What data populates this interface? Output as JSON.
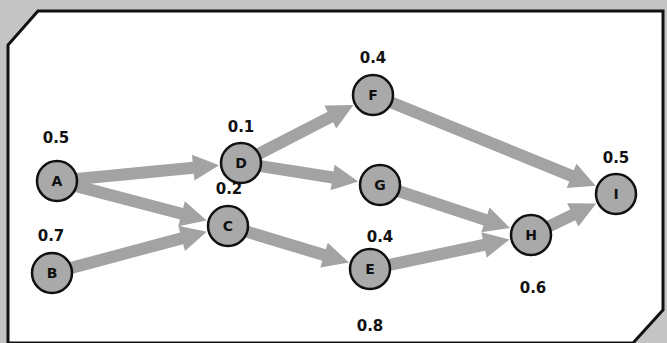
{
  "diagram": {
    "type": "directed-acyclic-graph",
    "colors": {
      "background": "#c4c4c4",
      "panel": "#ffffff",
      "node_fill": "#a9a9a9",
      "edge": "#a3a3a3",
      "stroke": "#111111"
    },
    "nodes": [
      {
        "id": "A",
        "label": "A",
        "value": "0.5",
        "x": 57,
        "y": 181,
        "vx": 56,
        "vy": 138,
        "vanchor": "middle"
      },
      {
        "id": "B",
        "label": "B",
        "value": "0.7",
        "x": 52,
        "y": 273,
        "vx": 51,
        "vy": 236,
        "vanchor": "middle"
      },
      {
        "id": "C",
        "label": "C",
        "value": "0.2",
        "x": 228,
        "y": 226,
        "vx": 229,
        "vy": 189,
        "vanchor": "middle"
      },
      {
        "id": "D",
        "label": "D",
        "value": "0.1",
        "x": 241,
        "y": 163,
        "vx": 241,
        "vy": 127,
        "vanchor": "middle"
      },
      {
        "id": "E",
        "label": "E",
        "value": "0.8",
        "x": 370,
        "y": 269,
        "vx": 370,
        "vy": 326,
        "vanchor": "middle"
      },
      {
        "id": "F",
        "label": "F",
        "value": "0.4",
        "x": 373,
        "y": 95,
        "vx": 373,
        "vy": 58,
        "vanchor": "middle"
      },
      {
        "id": "G",
        "label": "G",
        "value": "0.4",
        "x": 380,
        "y": 185,
        "vx": 380,
        "vy": 237,
        "vanchor": "middle"
      },
      {
        "id": "H",
        "label": "H",
        "value": "0.6",
        "x": 531,
        "y": 235,
        "vx": 533,
        "vy": 288,
        "vanchor": "middle"
      },
      {
        "id": "I",
        "label": "I",
        "value": "0.5",
        "x": 616,
        "y": 194,
        "vx": 616,
        "vy": 158,
        "vanchor": "middle"
      }
    ],
    "edges": [
      {
        "from": "A",
        "to": "D"
      },
      {
        "from": "A",
        "to": "C"
      },
      {
        "from": "B",
        "to": "C"
      },
      {
        "from": "D",
        "to": "F"
      },
      {
        "from": "D",
        "to": "G"
      },
      {
        "from": "C",
        "to": "E"
      },
      {
        "from": "F",
        "to": "I"
      },
      {
        "from": "G",
        "to": "H"
      },
      {
        "from": "E",
        "to": "H"
      },
      {
        "from": "H",
        "to": "I"
      }
    ]
  }
}
